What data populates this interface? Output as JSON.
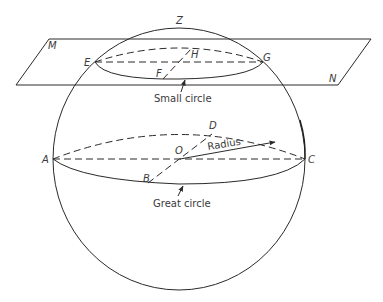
{
  "diagram": {
    "points": {
      "Z": "Z",
      "M": "M",
      "N": "N",
      "E": "E",
      "F": "F",
      "G": "G",
      "H": "H",
      "A": "A",
      "B": "B",
      "C": "C",
      "D": "D",
      "O": "O"
    },
    "captions": {
      "radius": "Radius",
      "small_circle": "Small circle",
      "great_circle": "Great circle"
    },
    "colors": {
      "line": "#2a2a2a",
      "text": "#3a3a3a",
      "background": "#ffffff"
    }
  }
}
